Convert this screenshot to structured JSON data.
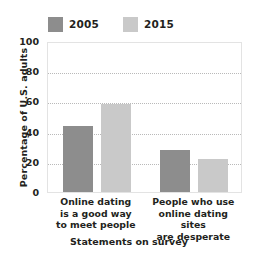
{
  "chart_data": {
    "type": "bar",
    "title": "",
    "subtitle": "",
    "xlabel": "Statements on survey",
    "ylabel": "Percentage of U.S. adults",
    "categories": [
      "Online dating is a good way to meet people",
      "People who use online dating sites are desperate"
    ],
    "category_lines": [
      [
        "Online dating",
        "is a good way",
        "to meet people"
      ],
      [
        "People who use",
        "online dating sites",
        "are desperate"
      ]
    ],
    "series": [
      {
        "name": "2005",
        "values": [
          44,
          28
        ],
        "color": "#8d8d8d"
      },
      {
        "name": "2015",
        "values": [
          58,
          22
        ],
        "color": "#c9c9c9"
      }
    ],
    "ylim": [
      0,
      100
    ],
    "yticks": [
      0,
      20,
      40,
      60,
      80,
      100
    ],
    "ytick_labels": [
      "0",
      "20",
      "40",
      "60",
      "80",
      "100"
    ],
    "gridlines": [
      20,
      40,
      60,
      80
    ],
    "grid": true,
    "grid_style": "dotted",
    "grid_color": "#b9b9b9",
    "legend_position": "top-left",
    "plot_border_color": "#e3e3e3",
    "background": "#ffffff",
    "text_color": "#231f20"
  },
  "legend": {
    "entries": [
      {
        "label": "2005",
        "color": "#8d8d8d"
      },
      {
        "label": "2015",
        "color": "#c9c9c9"
      }
    ]
  }
}
